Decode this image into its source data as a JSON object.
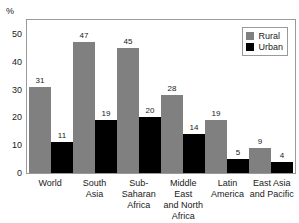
{
  "chart_data": {
    "type": "bar",
    "title": "",
    "subtitle": "",
    "xlabel": "",
    "ylabel": "%",
    "unit_label": "%",
    "ylim": [
      0,
      55
    ],
    "yticks": [
      0,
      10,
      20,
      30,
      40,
      50
    ],
    "ytick_labels": [
      "0",
      "10",
      "20",
      "30",
      "40",
      "50"
    ],
    "grid": false,
    "legend_position": "top-right",
    "categories": [
      "World",
      "South Asia",
      "Sub-Saharan Africa",
      "Middle East and North Africa",
      "Latin America",
      "East Asia and Pacific"
    ],
    "category_lines": [
      [
        "World"
      ],
      [
        "South",
        "Asia"
      ],
      [
        "Sub-",
        "Saharan",
        "Africa"
      ],
      [
        "Middle East",
        "and North",
        "Africa"
      ],
      [
        "Latin",
        "America"
      ],
      [
        "East Asia",
        "and Pacific"
      ]
    ],
    "series": [
      {
        "name": "Rural",
        "color": "#808080",
        "values": [
          31,
          47,
          45,
          28,
          19,
          9
        ]
      },
      {
        "name": "Urban",
        "color": "#000000",
        "values": [
          11,
          19,
          20,
          14,
          5,
          4
        ]
      }
    ]
  },
  "legend": {
    "items": [
      {
        "label": "Rural",
        "color": "#808080"
      },
      {
        "label": "Urban",
        "color": "#000000"
      }
    ]
  },
  "colors": {
    "rural": "#808080",
    "urban": "#000000",
    "frame": "#9a9a9a",
    "text": "#1a1a1a",
    "background": "#ffffff"
  }
}
